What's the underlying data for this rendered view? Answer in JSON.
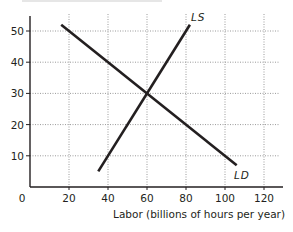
{
  "chart_data": {
    "type": "line",
    "title": "",
    "xlabel": "Labor (billions of hours per year)",
    "ylabel": "",
    "xlim": [
      0,
      130
    ],
    "ylim": [
      0,
      55
    ],
    "x_ticks": [
      20,
      40,
      60,
      80,
      100,
      120
    ],
    "y_ticks": [
      10,
      20,
      30,
      40,
      50
    ],
    "origin_label": "0",
    "grid": true,
    "grid_style": "dotted",
    "legend": "none (direct labels on curves)",
    "series": [
      {
        "name": "LD",
        "label": "LD",
        "description": "labor demand, downward sloping",
        "points": [
          [
            16,
            52
          ],
          [
            106,
            7
          ]
        ]
      },
      {
        "name": "LS",
        "label": "LS",
        "description": "labor supply, upward sloping",
        "points": [
          [
            35,
            5
          ],
          [
            82,
            52
          ]
        ]
      }
    ],
    "annotations": [
      {
        "text": "LS",
        "near": [
          83,
          54
        ]
      },
      {
        "text": "LD",
        "near": [
          102,
          4
        ]
      }
    ],
    "equilibrium": {
      "x": 60,
      "y": 30
    },
    "colors": {
      "lines": "#231f20",
      "grid": "#9a9a9a",
      "axes": "#231f20"
    }
  },
  "labels": {
    "origin": "0",
    "x_axis_title": "Labor (billions of hours per year)",
    "ls": "LS",
    "ld": "LD",
    "x_ticks": [
      "20",
      "40",
      "60",
      "80",
      "100",
      "120"
    ],
    "y_ticks": [
      "10",
      "20",
      "30",
      "40",
      "50"
    ]
  }
}
